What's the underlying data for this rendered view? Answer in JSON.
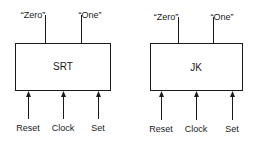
{
  "diagrams": [
    {
      "name": "SRT",
      "box": {
        "x": 15,
        "y": 43,
        "w": 96,
        "h": 48
      },
      "title": "SRT",
      "outputs": [
        {
          "label": "“Zero”",
          "x": 45
        },
        {
          "label": "“One”",
          "x": 81
        }
      ],
      "inputs": [
        {
          "label": "Reset",
          "x": 28
        },
        {
          "label": "Clock",
          "x": 63
        },
        {
          "label": "Set",
          "x": 98
        }
      ]
    },
    {
      "name": "JK",
      "box": {
        "x": 150,
        "y": 43,
        "w": 93,
        "h": 48
      },
      "title": "JK",
      "outputs": [
        {
          "label": "“Zero”",
          "x": 178
        },
        {
          "label": "“One”",
          "x": 213
        }
      ],
      "inputs": [
        {
          "label": "Reset",
          "x": 161
        },
        {
          "label": "Clock",
          "x": 196
        },
        {
          "label": "Set",
          "x": 232
        }
      ]
    }
  ]
}
